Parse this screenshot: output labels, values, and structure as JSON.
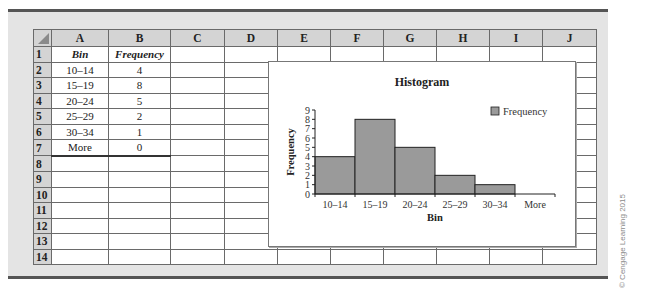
{
  "spreadsheet": {
    "columns": [
      "A",
      "B",
      "C",
      "D",
      "E",
      "F",
      "G",
      "H",
      "I",
      "J"
    ],
    "rows": [
      "1",
      "2",
      "3",
      "4",
      "5",
      "6",
      "7",
      "8",
      "9",
      "10",
      "11",
      "12",
      "13",
      "14"
    ],
    "cells": {
      "A1": "Bin",
      "B1": "Frequency",
      "A2": "10–14",
      "B2": "4",
      "A3": "15–19",
      "B3": "8",
      "A4": "20–24",
      "B4": "5",
      "A5": "25–29",
      "B5": "2",
      "A6": "30–34",
      "B6": "1",
      "A7": "More",
      "B7": "0"
    }
  },
  "chart_data": {
    "type": "bar",
    "title": "Histogram",
    "xlabel": "Bin",
    "ylabel": "Frequency",
    "categories": [
      "10–14",
      "15–19",
      "20–24",
      "25–29",
      "30–34",
      "More"
    ],
    "values": [
      4,
      8,
      5,
      2,
      1,
      0
    ],
    "series": [
      {
        "name": "Frequency",
        "values": [
          4,
          8,
          5,
          2,
          1,
          0
        ],
        "color": "#9a9a9a"
      }
    ],
    "ylim": [
      0,
      9
    ],
    "yticks": [
      0,
      1,
      2,
      3,
      4,
      5,
      6,
      7,
      8,
      9
    ],
    "grid": false,
    "legend_position": "right-top",
    "bar_gap": 0
  },
  "copyright": "© Cengage Learning 2015"
}
